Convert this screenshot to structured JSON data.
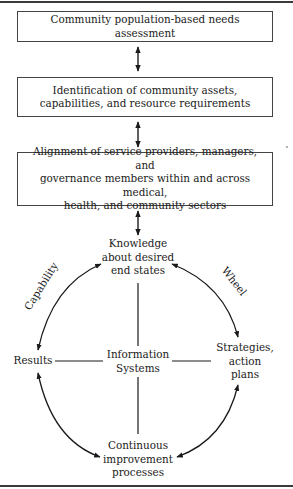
{
  "figure": {
    "boxes": [
      {
        "text": "Community population-based needs assessment"
      },
      {
        "line1": "Identification of community assets,",
        "line2": "capabilities, and resource requirements"
      },
      {
        "line1": "Alignment of service providers, managers, and",
        "line2": "governance members within and across medical,",
        "line3": "health, and community sectors"
      }
    ],
    "wheel": {
      "top_node": {
        "line1": "Knowledge",
        "line2": "about desired",
        "line3": "end states"
      },
      "left_node": {
        "text": "Results"
      },
      "center_node": {
        "line1": "Information",
        "line2": "Systems"
      },
      "right_node": {
        "line1": "Strategies,",
        "line2": "action",
        "line3": "plans"
      },
      "bottom_node": {
        "line1": "Continuous",
        "line2": "improvement",
        "line3": "processes"
      },
      "arc_label_left": "Capability",
      "arc_label_right": "Wheel"
    },
    "colors": {
      "line": "#1a1a1a",
      "box_border": "#444444",
      "rule": "#3a3a3a",
      "background": "#ffffff"
    }
  }
}
